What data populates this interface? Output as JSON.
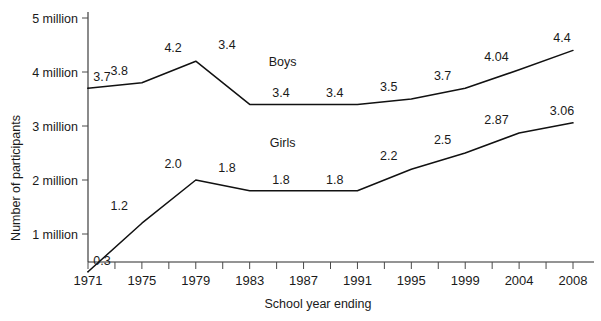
{
  "chart_data": {
    "type": "line",
    "title": "",
    "xlabel": "School year ending",
    "ylabel": "Number of participants",
    "categories": [
      "1971",
      "1972",
      "1973",
      "1974",
      "1975",
      "1976",
      "1977",
      "1978",
      "1979",
      "1980",
      "1981",
      "1982",
      "1983",
      "1984",
      "1985",
      "1986",
      "1987",
      "1988",
      "1989",
      "1990",
      "1991",
      "1992",
      "1993",
      "1994",
      "1995",
      "1996",
      "1997",
      "1998",
      "1999",
      "2000",
      "2002",
      "2004",
      "2006",
      "2008"
    ],
    "x_tick_labels": [
      "1971",
      "1975",
      "1979",
      "1983",
      "1987",
      "1991",
      "1995",
      "1999",
      "2004",
      "2008"
    ],
    "y_tick_labels": [
      "1 million",
      "2 million",
      "3 million",
      "4 million",
      "5 million"
    ],
    "y_tick_values": [
      1,
      2,
      3,
      4,
      5
    ],
    "ylim": [
      0,
      5.3
    ],
    "grid": false,
    "legend_position": "inline-annotation",
    "series": [
      {
        "name": "Boys",
        "label_x": "1983",
        "points": [
          {
            "x": "1971",
            "value": 3.7,
            "label": "3.7"
          },
          {
            "x": "1975",
            "value": 3.8,
            "label": "3.8"
          },
          {
            "x": "1979",
            "value": 4.2,
            "label": "4.2"
          },
          {
            "x": "1983",
            "value": 3.4,
            "label": "3.4"
          },
          {
            "x": "1987",
            "value": 3.4,
            "label": "3.4"
          },
          {
            "x": "1991",
            "value": 3.4,
            "label": "3.4"
          },
          {
            "x": "1995",
            "value": 3.5,
            "label": "3.5"
          },
          {
            "x": "1999",
            "value": 3.7,
            "label": "3.7"
          },
          {
            "x": "2004",
            "value": 4.04,
            "label": "4.04"
          },
          {
            "x": "2008",
            "value": 4.4,
            "label": "4.4"
          }
        ]
      },
      {
        "name": "Girls",
        "label_x": "1983",
        "points": [
          {
            "x": "1971",
            "value": 0.3,
            "label": "0.3"
          },
          {
            "x": "1975",
            "value": 1.2,
            "label": "1.2"
          },
          {
            "x": "1979",
            "value": 2.0,
            "label": "2.0"
          },
          {
            "x": "1983",
            "value": 1.8,
            "label": "1.8"
          },
          {
            "x": "1987",
            "value": 1.8,
            "label": "1.8"
          },
          {
            "x": "1991",
            "value": 1.8,
            "label": "1.8"
          },
          {
            "x": "1995",
            "value": 2.2,
            "label": "2.2"
          },
          {
            "x": "1999",
            "value": 2.5,
            "label": "2.5"
          },
          {
            "x": "2004",
            "value": 2.87,
            "label": "2.87"
          },
          {
            "x": "2008",
            "value": 3.06,
            "label": "3.06"
          }
        ]
      }
    ],
    "colors": {
      "line": "#111111",
      "axis": "#2b2b2b",
      "text": "#1a1a1a",
      "background": "#ffffff"
    }
  }
}
